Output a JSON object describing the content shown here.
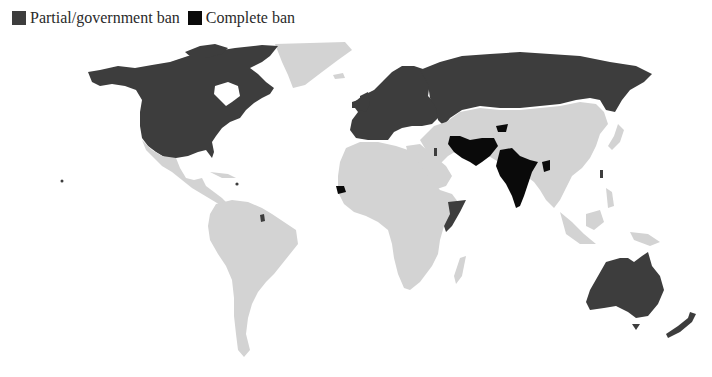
{
  "legend": {
    "items": [
      {
        "label": "Partial/government ban",
        "color": "#3d3d3d"
      },
      {
        "label": "Complete ban",
        "color": "#0a0a0a"
      }
    ]
  },
  "colors": {
    "partial": "#3d3d3d",
    "complete": "#0a0a0a",
    "none": "#d3d3d3",
    "background": "#ffffff"
  },
  "map": {
    "partial_regions": [
      "Canada",
      "United States",
      "Alaska",
      "Europe",
      "Russia",
      "Australia",
      "New Zealand",
      "Taiwan",
      "Puerto Rico",
      "French Guiana",
      "Israel",
      "Somalia"
    ],
    "complete_regions": [
      "India",
      "Iran",
      "Pakistan",
      "Afghanistan (part)",
      "Senegal",
      "Bangladesh"
    ],
    "no_ban_regions": [
      "Greenland",
      "Mexico",
      "Central America",
      "South America",
      "Africa",
      "Middle East",
      "China",
      "Central Asia",
      "Southeast Asia",
      "Mongolia"
    ]
  }
}
